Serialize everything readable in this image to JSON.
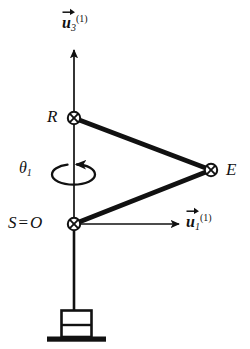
{
  "figure": {
    "type": "kinematic-schematic",
    "background_color": "#ffffff",
    "stroke_color": "#111111",
    "title": ""
  },
  "axes": {
    "vertical": {
      "name": "u3-axis",
      "base_symbol": "u",
      "subscript": "3",
      "superscript": "(1)",
      "label_text": "u3(1)",
      "direction": "up",
      "from": [
        74,
        224
      ],
      "to": [
        74,
        48
      ]
    },
    "horizontal": {
      "name": "u1-axis",
      "base_symbol": "u",
      "subscript": "1",
      "superscript": "(1)",
      "label_text": "u1(1)",
      "direction": "right",
      "from": [
        74,
        224
      ],
      "to": [
        181,
        224
      ]
    }
  },
  "angle": {
    "name": "theta1",
    "symbol": "θ",
    "subscript": "1",
    "label_text": "θ1",
    "rotation": "about vertical axis",
    "arrow_direction": "counterclockwise-viewed-from-top"
  },
  "points": [
    {
      "id": "R",
      "label": "R",
      "x": 74,
      "y": 118,
      "marker": "circled-x"
    },
    {
      "id": "E",
      "label": "E",
      "x": 211,
      "y": 170,
      "marker": "circled-x"
    },
    {
      "id": "SO",
      "label": "S",
      "label_equals": "=",
      "label_second": "O",
      "x": 74,
      "y": 224,
      "marker": "circled-x"
    }
  ],
  "links": [
    {
      "name": "link-R-E",
      "from": "R",
      "to": "E",
      "style": "thick"
    },
    {
      "name": "link-E-S",
      "from": "E",
      "to": "SO",
      "style": "thick"
    }
  ],
  "mast": {
    "name": "vertical-mast",
    "from": [
      74,
      224
    ],
    "to": [
      74,
      310
    ]
  },
  "base": {
    "name": "pedestal",
    "box": {
      "x": 61,
      "y": 310,
      "width": 31,
      "height": 27
    },
    "divider_y": 325,
    "ground": {
      "x": 47,
      "y": 337,
      "width": 59,
      "height": 5
    }
  }
}
